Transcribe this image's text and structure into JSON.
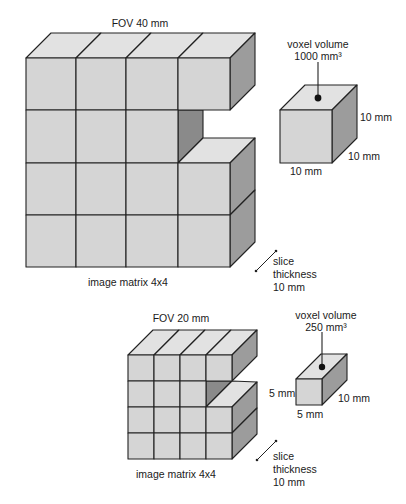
{
  "top_diagram": {
    "fov_label": "FOV 40 mm",
    "matrix_label": "image matrix 4x4",
    "slice_label": [
      "slice",
      "thickness",
      "10 mm"
    ],
    "voxel": {
      "title_line1": "voxel volume",
      "title_line2": "1000 mm³",
      "height_label": "10 mm",
      "depth_label": "10 mm",
      "width_label": "10 mm"
    }
  },
  "bottom_diagram": {
    "fov_label": "FOV 20 mm",
    "matrix_label": "image matrix 4x4",
    "slice_label": [
      "slice",
      "thickness",
      "10 mm"
    ],
    "voxel": {
      "title_line1": "voxel volume",
      "title_line2": "250 mm³",
      "height_label": "5 mm",
      "depth_label": "10 mm",
      "width_label": "5 mm"
    }
  },
  "colors": {
    "front_face": "#d5d5d5",
    "top_face": "#e2e2e2",
    "side_face": "#9c9c9c",
    "inner_face": "#8a8a8a",
    "stroke": "#222222"
  }
}
